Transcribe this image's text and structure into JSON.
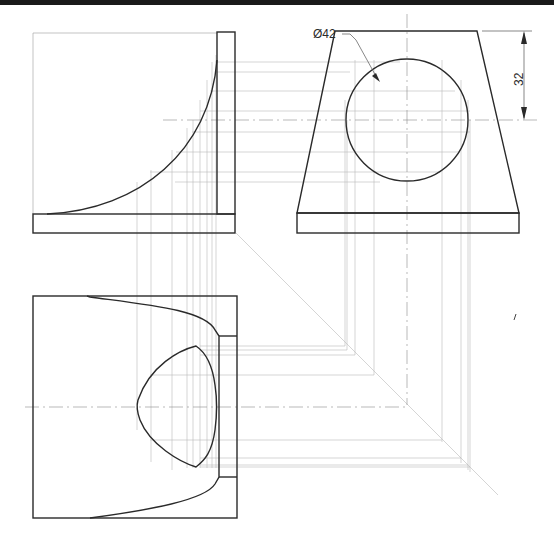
{
  "drawing": {
    "type": "orthographic projection construction",
    "views": [
      {
        "name": "front-view",
        "description": "profile with concave fillet, upright and base plate"
      },
      {
        "name": "side-view",
        "description": "tapered upright with circular hole on base plate"
      },
      {
        "name": "top-view",
        "description": "plan view showing projected oblong hole shape"
      }
    ],
    "annotations": {
      "diameter_label": "Ø42",
      "height_dimension": "32"
    },
    "colors": {
      "outline": "#2a2a2a",
      "construction": "#b8b8b8",
      "background": "#ffffff"
    }
  }
}
